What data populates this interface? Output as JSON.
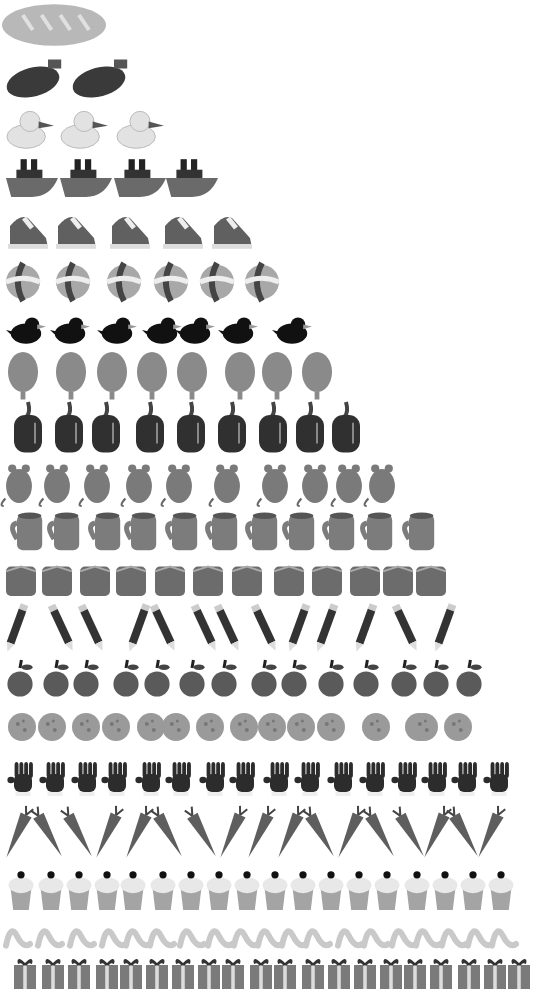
{
  "chart_data": {
    "type": "pictograph",
    "title": "",
    "xlabel": "",
    "ylabel": "",
    "layout": "counting pyramid, one row per number 1-20, top to bottom",
    "categories": [
      "bread",
      "eggplant",
      "duck",
      "boat",
      "shoe",
      "beach ball",
      "bird",
      "balloon",
      "pepper",
      "mouse",
      "mug",
      "block",
      "pencil",
      "apple",
      "cookie",
      "glove",
      "carrot",
      "cupcake",
      "worm",
      "gift"
    ],
    "values": [
      1,
      2,
      3,
      4,
      5,
      6,
      7,
      8,
      9,
      10,
      11,
      12,
      13,
      14,
      15,
      16,
      17,
      18,
      19,
      20
    ]
  },
  "rows": [
    {
      "name": "bread",
      "count": 1,
      "y": 0,
      "h": 50,
      "w": 104,
      "x": [
        2
      ],
      "fill": "#b8b8b8"
    },
    {
      "name": "eggplant",
      "count": 2,
      "y": 55,
      "h": 45,
      "w": 60,
      "x": [
        6,
        72
      ],
      "fill": "#3a3a3a"
    },
    {
      "name": "duck",
      "count": 3,
      "y": 108,
      "h": 42,
      "w": 48,
      "x": [
        6,
        60,
        116
      ],
      "fill": "#e2e2e2"
    },
    {
      "name": "boat",
      "count": 4,
      "y": 155,
      "h": 42,
      "w": 52,
      "x": [
        6,
        60,
        114,
        166
      ],
      "fill": "#6a6a6a"
    },
    {
      "name": "shoe",
      "count": 5,
      "y": 210,
      "h": 40,
      "w": 40,
      "x": [
        8,
        56,
        110,
        163,
        212
      ],
      "fill": "#606060"
    },
    {
      "name": "beach ball",
      "count": 6,
      "y": 263,
      "h": 38,
      "w": 34,
      "x": [
        6,
        56,
        107,
        154,
        200,
        245
      ],
      "fill": "#a8a8a8"
    },
    {
      "name": "bird",
      "count": 7,
      "y": 312,
      "h": 36,
      "w": 40,
      "x": [
        6,
        50,
        97,
        142,
        175,
        218,
        272
      ],
      "fill": "#111111"
    },
    {
      "name": "balloon",
      "count": 8,
      "y": 352,
      "h": 50,
      "w": 30,
      "x": [
        8,
        56,
        97,
        137,
        177,
        225,
        262,
        302
      ],
      "fill": "#8a8a8a"
    },
    {
      "name": "pepper",
      "count": 9,
      "y": 402,
      "h": 52,
      "w": 28,
      "x": [
        14,
        55,
        92,
        136,
        177,
        218,
        259,
        296,
        332
      ],
      "fill": "#303030"
    },
    {
      "name": "mouse",
      "count": 10,
      "y": 456,
      "h": 50,
      "w": 34,
      "x": [
        2,
        40,
        80,
        122,
        162,
        210,
        258,
        298,
        332,
        365
      ],
      "fill": "#7a7a7a"
    },
    {
      "name": "mug",
      "count": 11,
      "y": 511,
      "h": 40,
      "w": 36,
      "x": [
        8,
        45,
        86,
        122,
        163,
        203,
        243,
        280,
        320,
        358,
        400
      ],
      "fill": "#7c7c7c"
    },
    {
      "name": "block",
      "count": 12,
      "y": 565,
      "h": 32,
      "w": 30,
      "x": [
        6,
        42,
        80,
        116,
        155,
        193,
        232,
        274,
        312,
        350,
        383,
        416
      ],
      "fill": "#6c6c6c"
    },
    {
      "name": "pencil",
      "count": 13,
      "y": 603,
      "h": 50,
      "w": 20,
      "x": [
        6,
        52,
        82,
        128,
        154,
        195,
        218,
        255,
        288,
        316,
        355,
        396,
        434
      ],
      "fill": "#333333"
    },
    {
      "name": "apple",
      "count": 14,
      "y": 660,
      "h": 40,
      "w": 28,
      "x": [
        6,
        42,
        72,
        112,
        143,
        178,
        210,
        250,
        280,
        317,
        352,
        390,
        422,
        455
      ],
      "fill": "#5a5a5a"
    },
    {
      "name": "cookie",
      "count": 15,
      "y": 712,
      "h": 30,
      "w": 28,
      "x": [
        8,
        38,
        72,
        102,
        137,
        162,
        196,
        230,
        258,
        287,
        317,
        362,
        405,
        410,
        444
      ],
      "fill": "#9a9a9a"
    },
    {
      "name": "glove",
      "count": 16,
      "y": 760,
      "h": 40,
      "w": 30,
      "x": [
        8,
        40,
        72,
        102,
        136,
        166,
        200,
        230,
        264,
        295,
        328,
        360,
        392,
        422,
        452,
        484
      ],
      "fill": "#2c2c2c"
    },
    {
      "name": "carrot",
      "count": 17,
      "y": 805,
      "h": 55,
      "w": 20,
      "x": [
        8,
        38,
        68,
        98,
        128,
        158,
        192,
        222,
        250,
        280,
        310,
        340,
        370,
        400,
        426,
        454,
        480
      ],
      "fill": "#5e5e5e"
    },
    {
      "name": "cupcake",
      "count": 18,
      "y": 870,
      "h": 40,
      "w": 26,
      "x": [
        8,
        38,
        66,
        94,
        120,
        150,
        178,
        206,
        234,
        262,
        290,
        318,
        346,
        374,
        404,
        432,
        460,
        488
      ],
      "fill": "#a4a4a4"
    },
    {
      "name": "worm",
      "count": 19,
      "y": 920,
      "h": 32,
      "w": 26,
      "x": [
        4,
        36,
        68,
        100,
        124,
        148,
        178,
        206,
        232,
        256,
        280,
        304,
        336,
        362,
        390,
        414,
        440,
        466,
        490
      ],
      "fill": "#c9c9c9"
    },
    {
      "name": "gift",
      "count": 20,
      "y": 957,
      "h": 32,
      "w": 22,
      "x": [
        14,
        42,
        68,
        96,
        120,
        146,
        172,
        198,
        222,
        250,
        274,
        302,
        328,
        354,
        380,
        404,
        430,
        458,
        484,
        508
      ],
      "fill": "#7a7a7a"
    }
  ]
}
